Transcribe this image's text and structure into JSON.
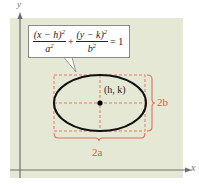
{
  "diagram": {
    "type": "ellipse-standard-form",
    "colors": {
      "panel_background": "#e6e8d6",
      "axis": "#6e6e6e",
      "ellipse": "#111111",
      "dimension_lines": "#e0705c",
      "dimension_labels": "#d9594a",
      "center_point": "#000000"
    },
    "axes": {
      "x_label": "x",
      "y_label": "y"
    },
    "equation": {
      "term1_numerator": "(x − h)",
      "term1_numerator_exp": "2",
      "term1_denominator": "a",
      "term1_denominator_exp": "2",
      "plus": "+",
      "term2_numerator": "(y − k)",
      "term2_numerator_exp": "2",
      "term2_denominator": "b",
      "term2_denominator_exp": "2",
      "equals": "= 1"
    },
    "center_label": "(h, k)",
    "horizontal_dimension_label": "2a",
    "vertical_dimension_label": "2b"
  }
}
